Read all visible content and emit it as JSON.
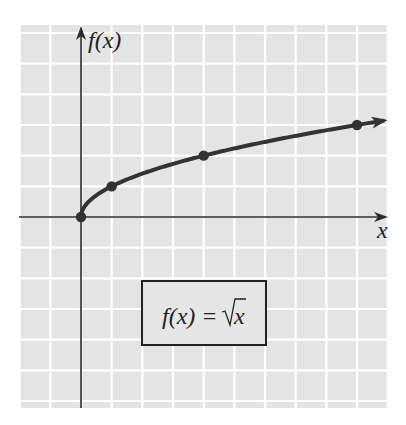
{
  "chart_data": {
    "type": "line",
    "title": "",
    "function_label": "f(x) = √x",
    "xlabel": "x",
    "ylabel": "f(x)",
    "xlim": [
      -2,
      10
    ],
    "ylim": [
      -6.2,
      6.2
    ],
    "grid": true,
    "grid_spacing": 1,
    "x_tick_labels": [],
    "y_tick_labels": [],
    "legend": null,
    "series": [
      {
        "name": "f(x) = √x",
        "curve_domain": [
          0,
          10
        ],
        "points": [
          {
            "x": 0,
            "y": 0
          },
          {
            "x": 1,
            "y": 1
          },
          {
            "x": 4,
            "y": 2
          },
          {
            "x": 9,
            "y": 3
          }
        ],
        "arrow_at_end": true
      }
    ]
  },
  "labels": {
    "x_axis": "x",
    "y_axis": "f(x)",
    "equation_lhs": "f(x) = ",
    "equation_radicand": "x"
  },
  "colors": {
    "grid_background": "#e4e4e4",
    "grid_lines": "#ffffff",
    "axes": "#2a2a2a",
    "curve": "#333333",
    "box_border": "#222222"
  }
}
